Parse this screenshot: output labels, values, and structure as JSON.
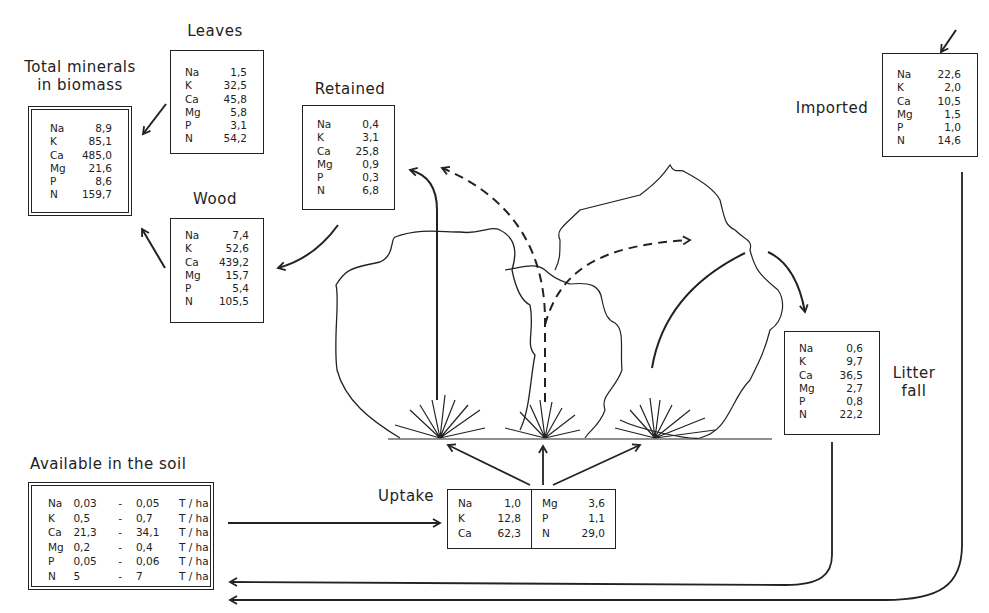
{
  "units_note": "",
  "boxes": {
    "total": {
      "label_line1": "Total minerals",
      "label_line2": "in biomass",
      "rows": [
        {
          "el": "Na",
          "val": "8,9"
        },
        {
          "el": "K",
          "val": "85,1"
        },
        {
          "el": "Ca",
          "val": "485,0"
        },
        {
          "el": "Mg",
          "val": "21,6"
        },
        {
          "el": "P",
          "val": "8,6"
        },
        {
          "el": "N",
          "val": "159,7"
        }
      ]
    },
    "leaves": {
      "label": "Leaves",
      "rows": [
        {
          "el": "Na",
          "val": "1,5"
        },
        {
          "el": "K",
          "val": "32,5"
        },
        {
          "el": "Ca",
          "val": "45,8"
        },
        {
          "el": "Mg",
          "val": "5,8"
        },
        {
          "el": "P",
          "val": "3,1"
        },
        {
          "el": "N",
          "val": "54,2"
        }
      ]
    },
    "wood": {
      "label": "Wood",
      "rows": [
        {
          "el": "Na",
          "val": "7,4"
        },
        {
          "el": "K",
          "val": "52,6"
        },
        {
          "el": "Ca",
          "val": "439,2"
        },
        {
          "el": "Mg",
          "val": "15,7"
        },
        {
          "el": "P",
          "val": "5,4"
        },
        {
          "el": "N",
          "val": "105,5"
        }
      ]
    },
    "retained": {
      "label": "Retained",
      "rows": [
        {
          "el": "Na",
          "val": "0,4"
        },
        {
          "el": "K",
          "val": "3,1"
        },
        {
          "el": "Ca",
          "val": "25,8"
        },
        {
          "el": "Mg",
          "val": "0,9"
        },
        {
          "el": "P",
          "val": "0,3"
        },
        {
          "el": "N",
          "val": "6,8"
        }
      ]
    },
    "imported": {
      "label": "Imported",
      "rows": [
        {
          "el": "Na",
          "val": "22,6"
        },
        {
          "el": "K",
          "val": "2,0"
        },
        {
          "el": "Ca",
          "val": "10,5"
        },
        {
          "el": "Mg",
          "val": "1,5"
        },
        {
          "el": "P",
          "val": "1,0"
        },
        {
          "el": "N",
          "val": "14,6"
        }
      ]
    },
    "litter": {
      "label_line1": "Litter",
      "label_line2": "fall",
      "rows": [
        {
          "el": "Na",
          "val": "0,6"
        },
        {
          "el": "K",
          "val": "9,7"
        },
        {
          "el": "Ca",
          "val": "36,5"
        },
        {
          "el": "Mg",
          "val": "2,7"
        },
        {
          "el": "P",
          "val": "0,8"
        },
        {
          "el": "N",
          "val": "22,2"
        }
      ]
    },
    "soil": {
      "label": "Available in the soil",
      "rows": [
        {
          "el": "Na",
          "lo": "0,03",
          "dash": "-",
          "hi": "0,05",
          "unit": "T / ha"
        },
        {
          "el": "K",
          "lo": "0,5",
          "dash": "-",
          "hi": "0,7",
          "unit": "T / ha"
        },
        {
          "el": "Ca",
          "lo": "21,3",
          "dash": "-",
          "hi": "34,1",
          "unit": "T / ha"
        },
        {
          "el": "Mg",
          "lo": "0,2",
          "dash": "-",
          "hi": "0,4",
          "unit": "T / ha"
        },
        {
          "el": "P",
          "lo": "0,05",
          "dash": "-",
          "hi": "0,06",
          "unit": "T / ha"
        },
        {
          "el": "N",
          "lo": "5",
          "dash": "-",
          "hi": "7",
          "unit": "T / ha"
        }
      ]
    },
    "uptake": {
      "label": "Uptake",
      "left": [
        {
          "el": "Na",
          "val": "1,0"
        },
        {
          "el": "K",
          "val": "12,8"
        },
        {
          "el": "Ca",
          "val": "62,3"
        }
      ],
      "right": [
        {
          "el": "Mg",
          "val": "3,6"
        },
        {
          "el": "P",
          "val": "1,1"
        },
        {
          "el": "N",
          "val": "29,0"
        }
      ]
    }
  },
  "colors": {
    "ink": "#222222",
    "background": "#ffffff"
  }
}
